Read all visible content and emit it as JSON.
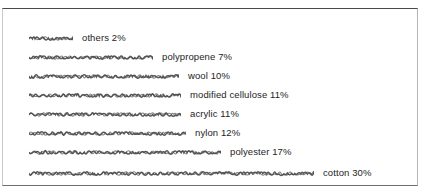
{
  "chart_data": {
    "type": "bar",
    "orientation": "horizontal",
    "title": "",
    "xlabel": "",
    "ylabel": "",
    "categories": [
      "others",
      "polypropene",
      "wool",
      "modified cellulose",
      "acrylic",
      "nylon",
      "polyester",
      "cotton"
    ],
    "values": [
      2,
      7,
      10,
      11,
      11,
      12,
      17,
      30
    ],
    "unit": "%",
    "xlim": [
      0,
      30
    ],
    "grid": false,
    "legend": false,
    "data_labels": [
      "others 2%",
      "polypropene 7%",
      "wool 10%",
      "modified cellulose 11%",
      "acrylic 11%",
      "nylon 12%",
      "polyester 17%",
      "cotton 30%"
    ],
    "bars": [
      {
        "label": "others 2%",
        "name": "others",
        "value": 2,
        "pixel_length": 44,
        "top": 22
      },
      {
        "label": "polypropene 7%",
        "name": "polypropene",
        "value": 7,
        "pixel_length": 124,
        "top": 41
      },
      {
        "label": "wool 10%",
        "name": "wool",
        "value": 10,
        "pixel_length": 150,
        "top": 60
      },
      {
        "label": "modified cellulose 11%",
        "name": "modified cellulose",
        "value": 11,
        "pixel_length": 152,
        "top": 79
      },
      {
        "label": "acrylic 11%",
        "name": "acrylic",
        "value": 11,
        "pixel_length": 152,
        "top": 98
      },
      {
        "label": "nylon 12%",
        "name": "nylon",
        "value": 12,
        "pixel_length": 157,
        "top": 117
      },
      {
        "label": "polyester 17%",
        "name": "polyester",
        "value": 17,
        "pixel_length": 192,
        "top": 136
      },
      {
        "label": "cotton 30%",
        "name": "cotton",
        "value": 30,
        "pixel_length": 285,
        "top": 157
      }
    ]
  },
  "colors": {
    "bar": "#4f4f4f",
    "text": "#1d1d1d",
    "frame": "#4a4a4a",
    "background": "#ffffff"
  }
}
